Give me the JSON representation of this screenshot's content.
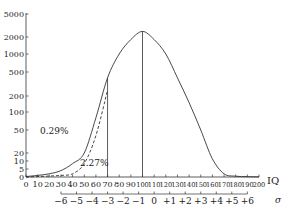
{
  "chart_data": {
    "type": "line",
    "title": "",
    "xlabel": "IQ",
    "ylabel": "",
    "secondary_xlabel": "σ",
    "y_scale": "log-like (non-linear)",
    "y_ticks": [
      0,
      5,
      10,
      20,
      50,
      100,
      200,
      500,
      1000,
      2000,
      5000
    ],
    "x_ticks": [
      0,
      10,
      20,
      30,
      40,
      50,
      60,
      70,
      80,
      90,
      100,
      110,
      120,
      130,
      140,
      150,
      160,
      170,
      180,
      190,
      200
    ],
    "sigma_ticks": [
      "−6",
      "−5",
      "−4",
      "−3",
      "−2",
      "−1",
      "0",
      "+1",
      "+2",
      "+3",
      "+4",
      "+5",
      "+6"
    ],
    "xlim": [
      0,
      200
    ],
    "ylim": [
      0,
      5000
    ],
    "grid": false,
    "series": [
      {
        "name": "normal distribution (solid)",
        "style": "solid",
        "x": [
          0,
          10,
          20,
          30,
          40,
          50,
          60,
          70,
          80,
          90,
          100,
          110,
          120,
          130,
          140,
          150,
          160,
          170,
          180,
          190,
          200
        ],
        "values": [
          0.3,
          1,
          2,
          4,
          8,
          20,
          80,
          400,
          1000,
          1800,
          2500,
          1800,
          1000,
          400,
          150,
          50,
          12,
          2,
          0.5,
          0.2,
          0.1
        ]
      },
      {
        "name": "comparison distribution (dashed)",
        "style": "dashed",
        "x": [
          0,
          10,
          20,
          30,
          40,
          50,
          60,
          70
        ],
        "values": [
          0,
          0.3,
          0.6,
          1,
          2,
          8,
          40,
          250
        ]
      }
    ],
    "vertical_lines": [
      {
        "x": 70,
        "y_top": 400
      },
      {
        "x": 100,
        "y_top": 2500
      }
    ],
    "annotations": [
      {
        "text": "0.29%",
        "x": 12,
        "y": 35
      },
      {
        "text": "2.27%",
        "x": 55,
        "y": 5
      }
    ]
  },
  "labels": {
    "annotation_left": "0.29%",
    "annotation_right": "2.27%",
    "x_axis_title": "IQ",
    "sigma_axis_title": "σ"
  }
}
